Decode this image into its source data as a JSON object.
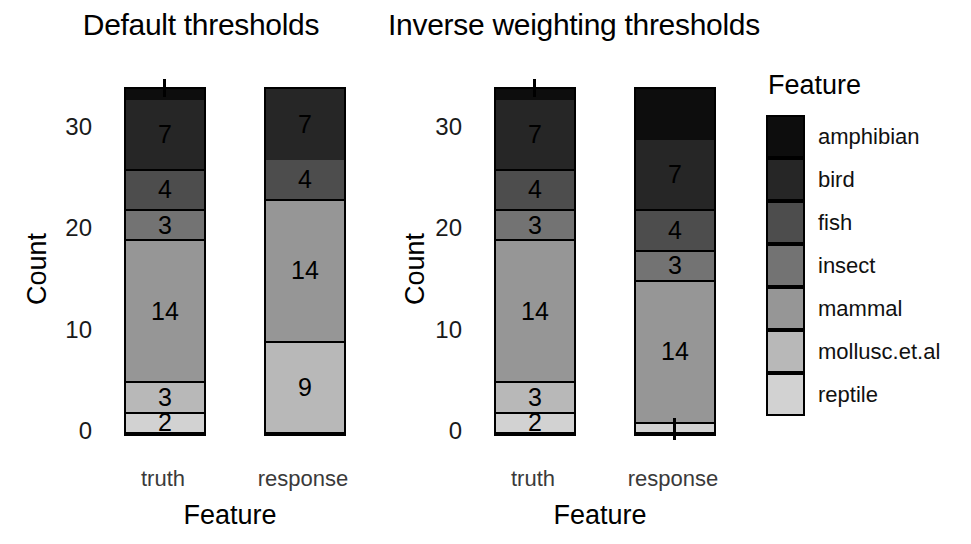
{
  "chart_data": {
    "type": "bar",
    "subtype": "stacked-bar",
    "title": "",
    "xlabel": "Feature",
    "ylabel": "Count",
    "categories": [
      "truth",
      "response"
    ],
    "ylim": [
      0,
      34
    ],
    "yticks": [
      0,
      10,
      20,
      30
    ],
    "ytick_labels": [
      "0",
      "10",
      "20",
      "30"
    ],
    "grid": false,
    "legend": {
      "title": "Feature",
      "position": "right",
      "entries": [
        {
          "label": "amphibian",
          "color": "#0d0d0d"
        },
        {
          "label": "bird",
          "color": "#262626"
        },
        {
          "label": "fish",
          "color": "#4d4d4d"
        },
        {
          "label": "insect",
          "color": "#737373"
        },
        {
          "label": "mammal",
          "color": "#969696"
        },
        {
          "label": "mollusc.et.al",
          "color": "#b8b8b8"
        },
        {
          "label": "reptile",
          "color": "#d2d2d2"
        }
      ]
    },
    "panels": [
      {
        "title": "Default thresholds",
        "bars": [
          {
            "category": "truth",
            "total": 34,
            "segments": [
              {
                "feature": "amphibian",
                "value": 1,
                "label": ""
              },
              {
                "feature": "bird",
                "value": 7,
                "label": "7"
              },
              {
                "feature": "fish",
                "value": 4,
                "label": "4"
              },
              {
                "feature": "insect",
                "value": 3,
                "label": "3"
              },
              {
                "feature": "mammal",
                "value": 14,
                "label": "14"
              },
              {
                "feature": "mollusc.et.al",
                "value": 3,
                "label": "3"
              },
              {
                "feature": "reptile",
                "value": 2,
                "label": "2"
              }
            ]
          },
          {
            "category": "response",
            "total": 34,
            "segments": [
              {
                "feature": "bird",
                "value": 7,
                "label": "7"
              },
              {
                "feature": "fish",
                "value": 4,
                "label": "4"
              },
              {
                "feature": "mammal",
                "value": 14,
                "label": "14"
              },
              {
                "feature": "mollusc.et.al",
                "value": 9,
                "label": "9"
              }
            ]
          }
        ]
      },
      {
        "title": "Inverse weighting thresholds",
        "bars": [
          {
            "category": "truth",
            "total": 34,
            "segments": [
              {
                "feature": "amphibian",
                "value": 1,
                "label": ""
              },
              {
                "feature": "bird",
                "value": 7,
                "label": "7"
              },
              {
                "feature": "fish",
                "value": 4,
                "label": "4"
              },
              {
                "feature": "insect",
                "value": 3,
                "label": "3"
              },
              {
                "feature": "mammal",
                "value": 14,
                "label": "14"
              },
              {
                "feature": "mollusc.et.al",
                "value": 3,
                "label": "3"
              },
              {
                "feature": "reptile",
                "value": 2,
                "label": "2"
              }
            ]
          },
          {
            "category": "response",
            "total": 34,
            "segments": [
              {
                "feature": "amphibian",
                "value": 5,
                "label": ""
              },
              {
                "feature": "bird",
                "value": 7,
                "label": "7"
              },
              {
                "feature": "fish",
                "value": 4,
                "label": "4"
              },
              {
                "feature": "insect",
                "value": 3,
                "label": "3"
              },
              {
                "feature": "mammal",
                "value": 14,
                "label": "14"
              },
              {
                "feature": "reptile",
                "value": 1,
                "label": ""
              }
            ]
          }
        ]
      }
    ]
  }
}
